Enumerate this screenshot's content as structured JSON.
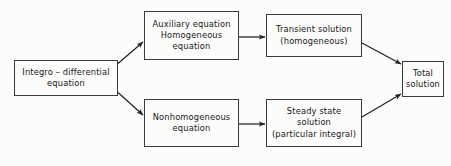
{
  "diagram": {
    "type": "flowchart",
    "colors": {
      "background": "#fcfcfa",
      "box_border": "#3a3a3a",
      "box_fill": "#fcfcfa",
      "text": "#171717",
      "arrow": "#232323"
    },
    "nodes": [
      {
        "id": "integro",
        "lines": [
          "Integro – differential",
          "equation"
        ]
      },
      {
        "id": "auxiliary",
        "lines": [
          "Auxiliary equation",
          "Homogeneous",
          "equation"
        ]
      },
      {
        "id": "nonhomogeneous",
        "lines": [
          "Nonhomogeneous",
          "equation"
        ]
      },
      {
        "id": "transient",
        "lines": [
          "Transient solution",
          "(homogeneous)"
        ]
      },
      {
        "id": "steady",
        "lines": [
          "Steady state",
          "solution",
          "(particular integral)"
        ]
      },
      {
        "id": "total",
        "lines": [
          "Total",
          "solution"
        ]
      }
    ],
    "edges": [
      {
        "id": "integro-to-auxiliary",
        "from": "integro",
        "to": "auxiliary",
        "style": "diagonal-up-right-arrow"
      },
      {
        "id": "integro-to-nonhomogeneous",
        "from": "integro",
        "to": "nonhomogeneous",
        "style": "diagonal-down-right-arrow"
      },
      {
        "id": "auxiliary-to-transient",
        "from": "auxiliary",
        "to": "transient",
        "style": "horizontal-right-arrow"
      },
      {
        "id": "nonhomogeneous-to-steady",
        "from": "nonhomogeneous",
        "to": "steady",
        "style": "horizontal-right-arrow"
      },
      {
        "id": "transient-to-total",
        "from": "transient",
        "to": "total",
        "style": "diagonal-down-right-arrow"
      },
      {
        "id": "steady-to-total",
        "from": "steady",
        "to": "total",
        "style": "diagonal-up-right-arrow"
      }
    ]
  }
}
